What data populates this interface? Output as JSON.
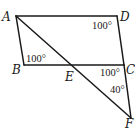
{
  "diagram": {
    "type": "geometry",
    "points": {
      "A": {
        "label": "A",
        "x": 16,
        "y": 16
      },
      "B": {
        "label": "B",
        "x": 24,
        "y": 65
      },
      "C": {
        "label": "C",
        "x": 124,
        "y": 65
      },
      "D": {
        "label": "D",
        "x": 117,
        "y": 16
      },
      "E": {
        "label": "E",
        "x": 75,
        "y": 65
      },
      "F": {
        "label": "F",
        "x": 131,
        "y": 118
      }
    },
    "segments": [
      [
        "A",
        "D"
      ],
      [
        "A",
        "B"
      ],
      [
        "B",
        "C"
      ],
      [
        "D",
        "C"
      ],
      [
        "C",
        "F"
      ],
      [
        "A",
        "F"
      ]
    ],
    "angles": [
      {
        "vertex": "D",
        "label": "100°"
      },
      {
        "vertex": "B",
        "label": "100°"
      },
      {
        "vertex": "C",
        "label": "100°",
        "between": "EC and CF side (angle ECF exterior)"
      },
      {
        "vertex": "F",
        "label": "40°"
      }
    ],
    "colors": {
      "stroke": "#1a1a1a",
      "background": "#ffffff"
    }
  }
}
